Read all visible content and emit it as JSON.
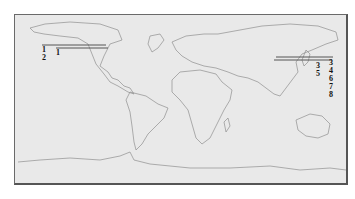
{
  "map": {
    "type": "world-outline",
    "background_color": "#e9e9e9",
    "outline_color": "#8a8a8a",
    "line_color": "#555555"
  },
  "markers": {
    "west": {
      "lines": [
        {
          "x1": 42,
          "x2": 106,
          "y": 45
        },
        {
          "x1": 56,
          "x2": 108,
          "y": 48
        }
      ],
      "labels": [
        {
          "text": "1",
          "x": 42,
          "y": 46
        },
        {
          "text": "2",
          "x": 42,
          "y": 54
        },
        {
          "text": "1",
          "x": 56,
          "y": 49
        }
      ]
    },
    "east": {
      "lines": [
        {
          "x1": 276,
          "x2": 333,
          "y": 57
        },
        {
          "x1": 274,
          "x2": 332,
          "y": 60
        }
      ],
      "labels": [
        {
          "text": "3",
          "x": 316,
          "y": 62
        },
        {
          "text": "5",
          "x": 316,
          "y": 70
        },
        {
          "text": "3",
          "x": 329,
          "y": 59
        },
        {
          "text": "4",
          "x": 329,
          "y": 67
        },
        {
          "text": "6",
          "x": 329,
          "y": 75
        },
        {
          "text": "7",
          "x": 329,
          "y": 83
        },
        {
          "text": "8",
          "x": 329,
          "y": 91
        }
      ]
    }
  }
}
